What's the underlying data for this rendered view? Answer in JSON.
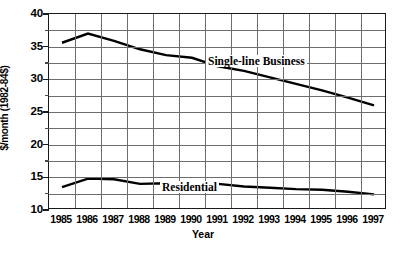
{
  "chart_data": {
    "type": "line",
    "title": "",
    "xlabel": "Year",
    "ylabel": "$/month (1982-84$)",
    "x": [
      1985,
      1986,
      1987,
      1988,
      1989,
      1990,
      1991,
      1992,
      1993,
      1994,
      1995,
      1996,
      1997
    ],
    "categories": [
      "1985",
      "1986",
      "1987",
      "1988",
      "1989",
      "1990",
      "1991",
      "1992",
      "1993",
      "1994",
      "1995",
      "1996",
      "1997"
    ],
    "xlim": [
      1984.5,
      1997.5
    ],
    "ylim": [
      10,
      40
    ],
    "ytick_labels": [
      "40",
      "35",
      "30",
      "25",
      "20",
      "15",
      "10"
    ],
    "ytick_values": [
      40,
      35,
      30,
      25,
      20,
      15,
      10
    ],
    "ygrid_values": [
      40,
      37.5,
      35,
      32.5,
      30,
      27.5,
      25,
      22.5,
      20,
      17.5,
      15,
      12.5,
      10
    ],
    "grid": true,
    "legend_position": "inline-annotation",
    "series": [
      {
        "name": "Single-line Business",
        "values": [
          35.6,
          37.0,
          35.9,
          34.6,
          33.7,
          33.3,
          32.0,
          31.3,
          30.3,
          29.3,
          28.3,
          27.2,
          26.0
        ]
      },
      {
        "name": "Residential",
        "values": [
          13.5,
          14.8,
          14.7,
          14.0,
          14.1,
          13.6,
          14.0,
          13.6,
          13.4,
          13.2,
          13.1,
          12.8,
          12.4
        ]
      }
    ],
    "annotations": [
      {
        "text": "Single-line Business",
        "series": "Single-line Business"
      },
      {
        "text": "Residential",
        "series": "Residential"
      }
    ]
  }
}
